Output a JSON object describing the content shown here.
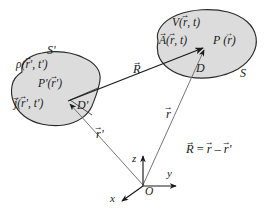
{
  "figure": {
    "background_color": "#ffffff",
    "ink_color": "#1a1a1a",
    "blob_fill_color": "#dcdcdc"
  },
  "source_region": {
    "surface_label": "S'",
    "volume_label": "D'",
    "charge_density": {
      "symbol": "ρ",
      "args": "(r', t')"
    },
    "current_density": {
      "symbol": "j",
      "args": "(r', t')"
    },
    "point_label": {
      "symbol": "P'",
      "args": "(r')"
    }
  },
  "field_region": {
    "surface_label": "S",
    "volume_label": "D",
    "scalar_potential": {
      "symbol": "V",
      "args": "(r, t)"
    },
    "vector_potential": {
      "symbol": "A",
      "args": "(r, t)"
    },
    "point_label": {
      "symbol": "P",
      "args": "(r)"
    }
  },
  "vectors": {
    "separation": "R",
    "field_position": "r",
    "source_position": "r'"
  },
  "axes": {
    "x_label": "x",
    "y_label": "y",
    "z_label": "z",
    "origin_label": "O"
  },
  "equation": {
    "lhs": "R",
    "relation": "=",
    "term1": "r",
    "operator": "–",
    "term2": "r'"
  }
}
